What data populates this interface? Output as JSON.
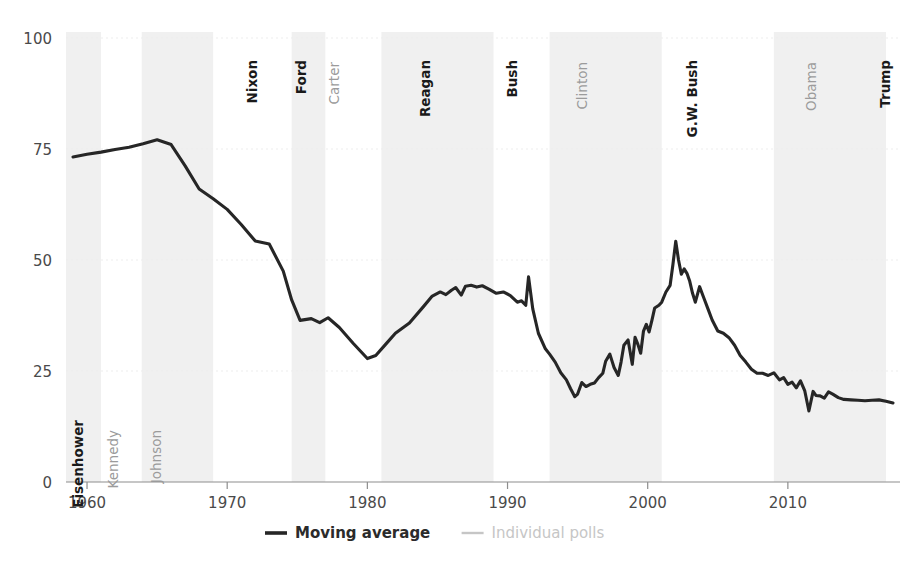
{
  "chart_data": {
    "type": "line",
    "title": "",
    "xlabel": "",
    "ylabel": "",
    "xlim": [
      1958.5,
      2018.0
    ],
    "ylim": [
      0,
      100
    ],
    "grid": true,
    "legend_position": "bottom-center",
    "xticks": [
      "1960",
      "1970",
      "1980",
      "1990",
      "2000",
      "2010"
    ],
    "xtick_values": [
      1960,
      1970,
      1980,
      1990,
      2000,
      2010
    ],
    "yticks": [
      "0",
      "25",
      "50",
      "75",
      "100"
    ],
    "ytick_values": [
      0,
      25,
      50,
      75,
      100
    ],
    "series": [
      {
        "name": "Moving average",
        "color": "#262626",
        "x": [
          1959.0,
          1960.0,
          1961.0,
          1962.0,
          1963.0,
          1964.0,
          1965.0,
          1966.0,
          1967.0,
          1968.0,
          1969.0,
          1970.0,
          1971.0,
          1972.0,
          1973.0,
          1974.0,
          1974.6,
          1975.2,
          1976.0,
          1976.6,
          1977.2,
          1978.0,
          1979.0,
          1980.0,
          1980.6,
          1981.3,
          1982.0,
          1983.0,
          1984.0,
          1984.6,
          1985.2,
          1985.6,
          1986.0,
          1986.3,
          1986.7,
          1987.0,
          1987.4,
          1987.8,
          1988.2,
          1988.7,
          1989.2,
          1989.7,
          1990.2,
          1990.7,
          1991.0,
          1991.3,
          1991.5,
          1991.8,
          1992.2,
          1992.7,
          1993.0,
          1993.4,
          1993.8,
          1994.2,
          1994.5,
          1994.8,
          1995.0,
          1995.3,
          1995.6,
          1995.9,
          1996.2,
          1996.5,
          1996.8,
          1997.0,
          1997.3,
          1997.6,
          1997.9,
          1998.1,
          1998.3,
          1998.6,
          1998.9,
          1999.1,
          1999.3,
          1999.5,
          1999.7,
          1999.9,
          2000.1,
          2000.3,
          2000.5,
          2000.8,
          2001.0,
          2001.3,
          2001.6,
          2001.8,
          2002.0,
          2002.2,
          2002.4,
          2002.6,
          2002.8,
          2003.0,
          2003.2,
          2003.4,
          2003.7,
          2004.0,
          2004.3,
          2004.6,
          2005.0,
          2005.4,
          2005.8,
          2006.2,
          2006.6,
          2007.0,
          2007.4,
          2007.8,
          2008.2,
          2008.6,
          2009.0,
          2009.4,
          2009.7,
          2010.0,
          2010.3,
          2010.6,
          2010.9,
          2011.2,
          2011.5,
          2011.8,
          2012.0,
          2012.3,
          2012.6,
          2012.9,
          2013.2,
          2013.6,
          2014.0,
          2014.5,
          2015.0,
          2015.5,
          2016.0,
          2016.5,
          2017.0,
          2017.5
        ],
        "y": [
          73.2,
          73.8,
          74.3,
          74.9,
          75.4,
          76.2,
          77.1,
          76.0,
          71.2,
          66.0,
          63.8,
          61.4,
          58.0,
          54.3,
          53.6,
          47.5,
          41.0,
          36.4,
          36.8,
          35.9,
          37.0,
          34.8,
          31.2,
          27.8,
          28.5,
          31.0,
          33.5,
          35.8,
          39.5,
          41.8,
          42.8,
          42.2,
          43.2,
          43.8,
          42.1,
          44.1,
          44.3,
          43.9,
          44.2,
          43.4,
          42.5,
          42.8,
          42.0,
          40.5,
          40.8,
          39.8,
          46.2,
          39.0,
          33.5,
          30.0,
          28.8,
          27.0,
          24.6,
          23.0,
          21.0,
          19.2,
          19.8,
          22.4,
          21.5,
          22.0,
          22.3,
          23.5,
          24.5,
          27.2,
          28.8,
          25.8,
          24.0,
          27.0,
          30.8,
          32.0,
          26.5,
          32.6,
          31.0,
          29.0,
          34.0,
          35.5,
          33.8,
          36.4,
          39.2,
          39.8,
          40.5,
          42.8,
          44.3,
          49.0,
          54.2,
          50.0,
          46.8,
          48.0,
          47.0,
          45.2,
          42.5,
          40.5,
          44.0,
          41.5,
          39.0,
          36.5,
          34.0,
          33.5,
          32.5,
          30.8,
          28.5,
          27.0,
          25.4,
          24.5,
          24.5,
          24.0,
          24.6,
          23.0,
          23.5,
          22.0,
          22.5,
          21.2,
          22.8,
          20.6,
          16.0,
          20.4,
          19.5,
          19.4,
          18.9,
          20.3,
          19.8,
          19.0,
          18.6,
          18.5,
          18.4,
          18.3,
          18.4,
          18.5,
          18.2,
          17.8
        ]
      }
    ],
    "legend": [
      {
        "label": "Moving average",
        "color": "#262626",
        "style": "solid-dark"
      },
      {
        "label": "Individual polls",
        "color": "#c6c6c6",
        "style": "solid-light"
      }
    ],
    "presidency_bands": [
      {
        "name": "Eisenhower",
        "party": "rep",
        "start": 1958.5,
        "end": 1961.0,
        "shaded": true
      },
      {
        "name": "Kennedy",
        "party": "dem",
        "start": 1961.0,
        "end": 1963.9,
        "shaded": false
      },
      {
        "name": "Johnson",
        "party": "dem",
        "start": 1963.9,
        "end": 1969.0,
        "shaded": true
      },
      {
        "name": "Nixon",
        "party": "rep",
        "start": 1969.0,
        "end": 1974.6,
        "shaded": false
      },
      {
        "name": "Ford",
        "party": "rep",
        "start": 1974.6,
        "end": 1977.0,
        "shaded": true
      },
      {
        "name": "Carter",
        "party": "dem",
        "start": 1977.0,
        "end": 1981.0,
        "shaded": false
      },
      {
        "name": "Reagan",
        "party": "rep",
        "start": 1981.0,
        "end": 1989.0,
        "shaded": true
      },
      {
        "name": "Bush",
        "party": "rep",
        "start": 1989.0,
        "end": 1993.0,
        "shaded": false
      },
      {
        "name": "Clinton",
        "party": "dem",
        "start": 1993.0,
        "end": 2001.0,
        "shaded": true
      },
      {
        "name": "G.W. Bush",
        "party": "rep",
        "start": 2001.0,
        "end": 2009.0,
        "shaded": false
      },
      {
        "name": "Obama",
        "party": "dem",
        "start": 2009.0,
        "end": 2017.0,
        "shaded": true
      },
      {
        "name": "Trump",
        "party": "rep",
        "start": 2017.0,
        "end": 2018.0,
        "shaded": false
      }
    ],
    "president_label_positions": [
      {
        "name": "Eisenhower",
        "party": "rep",
        "x": 1959.7,
        "y_top": 420
      },
      {
        "name": "Kennedy",
        "party": "dem",
        "x": 1962.2,
        "y_top": 430
      },
      {
        "name": "Johnson",
        "party": "dem",
        "x": 1965.3,
        "y_top": 430
      },
      {
        "name": "Nixon",
        "party": "rep",
        "x": 1972.1,
        "y_top": 60
      },
      {
        "name": "Ford",
        "party": "rep",
        "x": 1975.6,
        "y_top": 60
      },
      {
        "name": "Carter",
        "party": "dem",
        "x": 1978.0,
        "y_top": 62
      },
      {
        "name": "Reagan",
        "party": "rep",
        "x": 1984.5,
        "y_top": 60
      },
      {
        "name": "Bush",
        "party": "rep",
        "x": 1990.7,
        "y_top": 60
      },
      {
        "name": "Clinton",
        "party": "dem",
        "x": 1995.7,
        "y_top": 62
      },
      {
        "name": "G.W. Bush",
        "party": "rep",
        "x": 2003.5,
        "y_top": 60
      },
      {
        "name": "Obama",
        "party": "dem",
        "x": 2012.0,
        "y_top": 62
      },
      {
        "name": "Trump",
        "party": "rep",
        "x": 2017.3,
        "y_top": 60
      }
    ]
  },
  "colors": {
    "line": "#262626",
    "band": "#f0f0f0",
    "axis": "#8e8e8e",
    "grid": "#ededed",
    "tick_text": "#4a4a4a",
    "republican_label": "#1a1a1a",
    "democrat_label": "#9b9b9b",
    "legend_light": "#c6c6c6",
    "background": "#ffffff"
  }
}
